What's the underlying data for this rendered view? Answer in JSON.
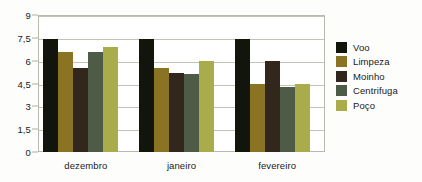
{
  "chart_data": {
    "type": "bar",
    "title": "",
    "xlabel": "",
    "ylabel": "",
    "categories": [
      "dezembro",
      "janeiro",
      "fevereiro"
    ],
    "ylim": [
      0,
      9
    ],
    "yticks": [
      "0",
      "1,5",
      "3",
      "4,5",
      "6",
      "7,5",
      "9"
    ],
    "ytick_values": [
      0,
      1.5,
      3,
      4.5,
      6,
      7.5,
      9
    ],
    "grid": true,
    "legend_position": "right",
    "series": [
      {
        "name": "Voo",
        "color": "#12150c",
        "values": [
          7.4,
          7.4,
          7.4
        ]
      },
      {
        "name": "Limpeza",
        "color": "#8a7322",
        "values": [
          6.6,
          5.5,
          4.5
        ]
      },
      {
        "name": "Moinho",
        "color": "#33261c",
        "values": [
          5.5,
          5.2,
          6.0
        ]
      },
      {
        "name": "Centrifuga",
        "color": "#4e5c47",
        "values": [
          6.6,
          5.1,
          4.3
        ]
      },
      {
        "name": "Poço",
        "color": "#a8ac4a",
        "values": [
          6.9,
          6.0,
          4.5
        ]
      }
    ]
  }
}
